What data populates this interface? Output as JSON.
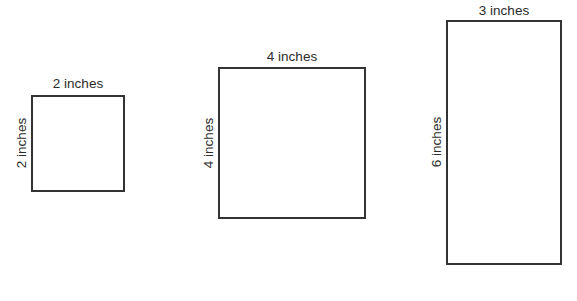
{
  "figure": {
    "shapes": [
      {
        "name": "square-2in",
        "width_label": "2 inches",
        "height_label": "2 inches",
        "width_in": 2,
        "height_in": 2
      },
      {
        "name": "square-4in",
        "width_label": "4 inches",
        "height_label": "4 inches",
        "width_in": 4,
        "height_in": 4
      },
      {
        "name": "rectangle-3x6in",
        "width_label": "3 inches",
        "height_label": "6 inches",
        "width_in": 3,
        "height_in": 6
      }
    ],
    "colors": {
      "stroke": "#333333",
      "text": "#2b2b2b",
      "background": "#ffffff"
    }
  }
}
